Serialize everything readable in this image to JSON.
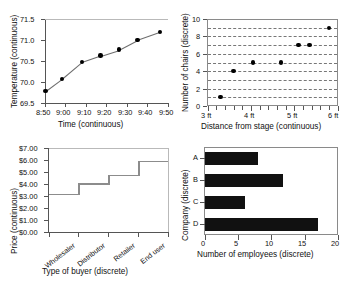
{
  "figure": {
    "panel_count": 4,
    "background": "#ffffff",
    "marker_color": "#000000",
    "line_color": "#6d6d6d",
    "step_color": "#8c8c8c",
    "bar_color": "#111111",
    "axis_color": "#555555",
    "gridline_color": "#777777"
  },
  "chart_data": [
    {
      "id": "temperature-line",
      "position": "top-left",
      "type": "line",
      "title": "",
      "xlabel": "Time (continuous)",
      "ylabel": "Temperature (continuous)",
      "xticklabels": [
        "8:50",
        "9:00",
        "9:10",
        "9:20",
        "9:30",
        "9:40",
        "9:50"
      ],
      "yticklabels": [
        "69.5",
        "70.0",
        "70.5",
        "71.0",
        "71.5"
      ],
      "ylim": [
        69.5,
        71.5
      ],
      "xlim": [
        0,
        60
      ],
      "grid": false,
      "markers": true,
      "x": [
        0,
        8,
        18,
        27,
        36,
        45,
        56
      ],
      "y": [
        69.78,
        70.07,
        70.48,
        70.63,
        70.77,
        71.0,
        71.19
      ],
      "x_labels_for_points": [
        "8:50",
        "8:58",
        "9:08",
        "9:17",
        "9:26",
        "9:35",
        "9:46"
      ]
    },
    {
      "id": "chairs-scatter",
      "position": "top-right",
      "type": "scatter",
      "title": "",
      "xlabel": "Distance from stage (continuous)",
      "ylabel": "Number of chairs (discrete)",
      "xticklabels": [
        "3 ft",
        "4 ft",
        "5 ft",
        "6 ft"
      ],
      "yticklabels": [
        "0",
        "2",
        "4",
        "6",
        "8",
        "10"
      ],
      "ylim": [
        0,
        10
      ],
      "xlim": [
        3,
        6
      ],
      "grid": true,
      "grid_style": "dashed-horizontal",
      "x": [
        3.3,
        3.6,
        4.05,
        4.7,
        5.1,
        5.35,
        5.8
      ],
      "y": [
        1,
        4,
        5,
        5,
        7,
        7,
        9
      ]
    },
    {
      "id": "price-step",
      "position": "bottom-left",
      "type": "line",
      "subtype": "step",
      "title": "",
      "xlabel": "Type of buyer (discrete)",
      "ylabel": "Price (continuous)",
      "categories": [
        "Wholesaler",
        "Distributor",
        "Retailer",
        "End user"
      ],
      "values": [
        3.2,
        4.05,
        4.75,
        5.95
      ],
      "yticklabels": [
        "$0.00",
        "$1.00",
        "$2.00",
        "$3.00",
        "$4.00",
        "$5.00",
        "$6.00",
        "$7.00"
      ],
      "ylim": [
        0,
        7
      ],
      "grid": false
    },
    {
      "id": "employees-bar",
      "position": "bottom-right",
      "type": "bar",
      "orientation": "horizontal",
      "title": "",
      "xlabel": "Number of employees (discrete)",
      "ylabel": "Company (discrete)",
      "categories": [
        "A",
        "B",
        "C",
        "D"
      ],
      "values": [
        8,
        11.7,
        6,
        17
      ],
      "xticklabels": [
        "0",
        "5",
        "10",
        "15",
        "20"
      ],
      "xlim": [
        0,
        20
      ],
      "grid": false
    }
  ]
}
